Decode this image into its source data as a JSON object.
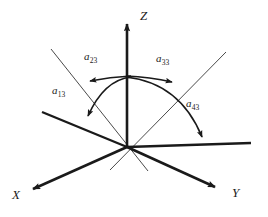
{
  "figure": {
    "background_color": "#ffffff",
    "stroke_color": "#1a1a1a",
    "thin_stroke_color": "#4a4a4a",
    "axes": [
      {
        "name": "z-axis",
        "label": "Z",
        "from": [
          127,
          147
        ],
        "to": [
          127,
          22
        ],
        "arrow": true,
        "weight": "thick"
      },
      {
        "name": "x-axis",
        "label": "X",
        "from": [
          127,
          147
        ],
        "to": [
          30,
          190
        ],
        "arrow": true,
        "weight": "thick"
      },
      {
        "name": "y-axis",
        "label": "Y",
        "from": [
          127,
          147
        ],
        "to": [
          218,
          188
        ],
        "arrow": true,
        "weight": "thick"
      }
    ],
    "reference_lines": [
      {
        "name": "horizontal-reference-line",
        "from": [
          127,
          147
        ],
        "to": [
          251,
          143
        ],
        "arrow": false,
        "weight": "thick"
      },
      {
        "name": "left-oblique-line",
        "from": [
          127,
          147
        ],
        "to": [
          42,
          112
        ],
        "arrow": false,
        "weight": "thick"
      },
      {
        "name": "thin-line-upper-left",
        "from": [
          51,
          49
        ],
        "to": [
          148,
          171
        ],
        "arrow": false,
        "weight": "thin"
      },
      {
        "name": "thin-line-upper-right",
        "from": [
          226,
          52
        ],
        "to": [
          110,
          170
        ],
        "arrow": false,
        "weight": "thin"
      }
    ],
    "arcs": [
      {
        "name": "arc-a23",
        "label": "a",
        "sub": "23",
        "direction": "left",
        "arrow": true
      },
      {
        "name": "arc-a33",
        "label": "a",
        "sub": "33",
        "direction": "right",
        "arrow": true
      },
      {
        "name": "arc-a13",
        "label": "a",
        "sub": "13",
        "direction": "down-left",
        "arrow": true
      },
      {
        "name": "arc-a43",
        "label": "a",
        "sub": "43",
        "direction": "down-right",
        "arrow": true
      }
    ],
    "labels": {
      "z": "Z",
      "x": "X",
      "y": "Y",
      "a13_base": "a",
      "a13_sub": "13",
      "a23_base": "a",
      "a23_sub": "23",
      "a33_base": "a",
      "a33_sub": "33",
      "a43_base": "a",
      "a43_sub": "43"
    },
    "origin": [
      127,
      147
    ]
  }
}
